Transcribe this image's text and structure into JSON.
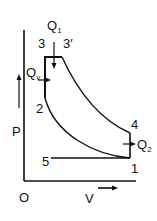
{
  "diagram": {
    "type": "PV diagram (dual/mixed combustion cycle)",
    "axes": {
      "y_label": "P",
      "x_label": "V",
      "origin_label": "O"
    },
    "points": {
      "p1": "1",
      "p2": "2",
      "p3": "3",
      "p3p": "3′",
      "p4": "4",
      "p5": "5"
    },
    "heat": {
      "q1_main": "Q",
      "q1_sub": "1",
      "qv_main": "Q",
      "qv_sub": "v",
      "q2_main": "Q",
      "q2_sub": "2"
    },
    "colors": {
      "line": "#111111",
      "background": "#ffffff"
    }
  }
}
